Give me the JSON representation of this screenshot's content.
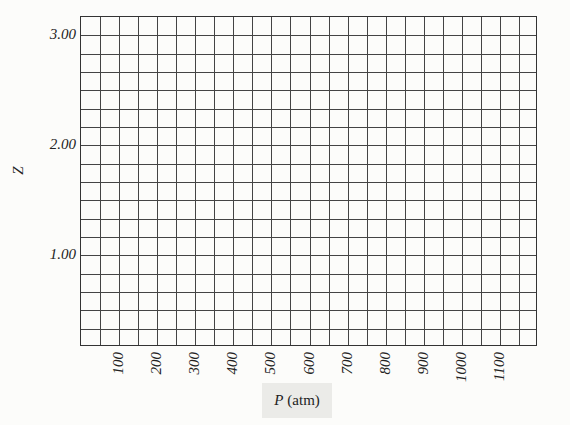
{
  "chart_data": {
    "type": "line",
    "title": "",
    "xlabel": "P (atm)",
    "xlabel_var": "P",
    "xlabel_unit": "(atm)",
    "ylabel": "Z",
    "xlim": [
      0,
      1200
    ],
    "ylim": [
      0.1667,
      3.1667
    ],
    "grid": true,
    "grid_x_step": 50,
    "grid_y_step": 0.1667,
    "x_columns": 24,
    "y_rows": 18,
    "x_ticks": [
      "100",
      "200",
      "300",
      "400",
      "500",
      "600",
      "700",
      "800",
      "900",
      "1000",
      "1100"
    ],
    "x_tick_values": [
      100,
      200,
      300,
      400,
      500,
      600,
      700,
      800,
      900,
      1000,
      1100
    ],
    "y_ticks": [
      "1.00",
      "2.00",
      "3.00"
    ],
    "y_tick_values": [
      1.0,
      2.0,
      3.0
    ],
    "series": [],
    "legend": null
  },
  "colors": {
    "background": "#fcfcfa",
    "grid": "#444444",
    "label_box": "#ebebe8"
  }
}
